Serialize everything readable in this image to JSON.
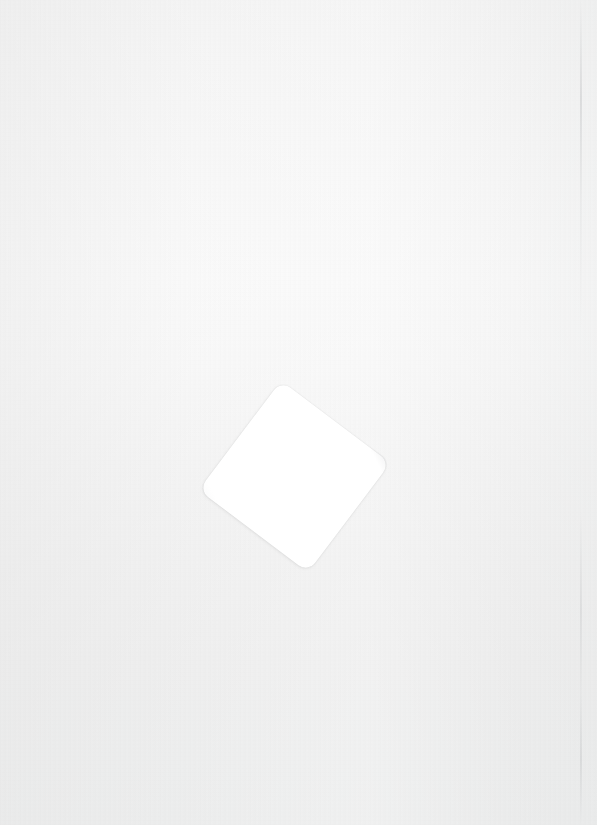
{
  "canvas": {
    "width": 597,
    "height": 825,
    "background_color_top": "#f2f2f2",
    "background_color_mid": "#f9f9f9",
    "background_color_bottom": "#e8e9e9",
    "description": "blank light-gray paper-like surface"
  },
  "artifacts": {
    "scan_line": {
      "x": 580,
      "color": "#aaacaf"
    }
  },
  "card": {
    "shape": "rounded-square",
    "fill_color": "#ffffff",
    "center_x": 294,
    "center_y": 476,
    "size": 137,
    "corner_radius": 12,
    "rotation_deg": 37,
    "content": "",
    "edge_shadow_color": "#787a7d"
  }
}
